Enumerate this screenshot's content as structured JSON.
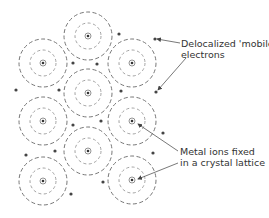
{
  "labels": {
    "electrons_line1": "Delocalized 'mobile'",
    "electrons_line2": "electrons",
    "ions_line1": "Metal ions fixed",
    "ions_line2": "in a crystal lattice"
  },
  "colors": {
    "outer_shell": "#777777",
    "inner_shell": "#999999",
    "electron": "#444444",
    "text": "#333333"
  },
  "ions": [
    {
      "x": 88,
      "y": 36
    },
    {
      "x": 43,
      "y": 63
    },
    {
      "x": 132,
      "y": 63
    },
    {
      "x": 88,
      "y": 93
    },
    {
      "x": 43,
      "y": 121
    },
    {
      "x": 132,
      "y": 121
    },
    {
      "x": 88,
      "y": 151
    },
    {
      "x": 43,
      "y": 181
    },
    {
      "x": 132,
      "y": 180
    }
  ],
  "electrons": [
    {
      "x": 119,
      "y": 34
    },
    {
      "x": 155,
      "y": 39
    },
    {
      "x": 73,
      "y": 63
    },
    {
      "x": 97,
      "y": 64
    },
    {
      "x": 16,
      "y": 90
    },
    {
      "x": 59,
      "y": 90
    },
    {
      "x": 121,
      "y": 91
    },
    {
      "x": 156,
      "y": 92
    },
    {
      "x": 73,
      "y": 125
    },
    {
      "x": 101,
      "y": 121
    },
    {
      "x": 163,
      "y": 133
    },
    {
      "x": 26,
      "y": 155
    },
    {
      "x": 55,
      "y": 151
    },
    {
      "x": 153,
      "y": 153
    },
    {
      "x": 103,
      "y": 182
    },
    {
      "x": 71,
      "y": 194
    }
  ]
}
